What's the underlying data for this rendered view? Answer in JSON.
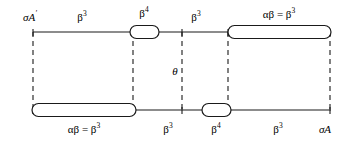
{
  "figure": {
    "background_color": "#ffffff",
    "line_color": "#1a1a1a",
    "width": 350,
    "height": 145
  },
  "labels": {
    "top_left_endpoint": {
      "base": "σA",
      "sup": "′",
      "x": 30,
      "y": 12
    },
    "top_segment_1": {
      "base": "β",
      "sup": "3",
      "x": 82,
      "y": 12
    },
    "top_node_capsule_small": {
      "base": "β",
      "sup": "4",
      "x": 144,
      "y": 8
    },
    "top_segment_2": {
      "base": "β",
      "sup": "3",
      "x": 196,
      "y": 12
    },
    "top_node_capsule_long": {
      "base": "αβ = β",
      "sup": "3",
      "x": 279,
      "y": 9
    },
    "center_angle": {
      "base": "θ",
      "sup": "",
      "x": 178,
      "y": 67
    },
    "bottom_node_capsule_long": {
      "base": "αβ = β",
      "sup": "3",
      "x": 84,
      "y": 124
    },
    "bottom_segment_1": {
      "base": "β",
      "sup": "3",
      "x": 168,
      "y": 124
    },
    "bottom_node_capsule_small": {
      "base": "β",
      "sup": "4",
      "x": 216,
      "y": 124
    },
    "bottom_segment_2": {
      "base": "β",
      "sup": "3",
      "x": 278,
      "y": 124
    },
    "bottom_right_endpoint": {
      "base": "σA",
      "sup": "",
      "x": 325,
      "y": 124
    }
  },
  "geometry": {
    "top_line_y": 32,
    "bottom_line_y": 110,
    "left_x": 33,
    "right_x": 330,
    "dashed_verticals": [
      33,
      133,
      182,
      228,
      330
    ],
    "capsules": [
      {
        "name": "top-small-capsule",
        "x1": 130,
        "x2": 159,
        "cy": 32,
        "h": 13
      },
      {
        "name": "top-long-capsule",
        "x1": 228,
        "x2": 331,
        "cy": 32,
        "h": 13
      },
      {
        "name": "bottom-long-capsule",
        "x1": 32,
        "x2": 136,
        "cy": 110,
        "h": 13
      },
      {
        "name": "bottom-small-capsule",
        "x1": 202,
        "x2": 231,
        "cy": 110,
        "h": 13
      }
    ]
  }
}
